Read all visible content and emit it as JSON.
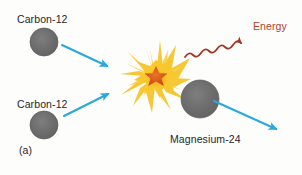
{
  "figure": {
    "caption_label": "(a)",
    "background_color": "#fdfdfc",
    "width": 302,
    "height": 175,
    "process": "nuclear fusion of two carbon-12 nuclei"
  },
  "labels": {
    "reactant_top": "Carbon-12",
    "reactant_bottom": "Carbon-12",
    "product_nucleus": "Magnesium-24",
    "product_energy": "Energy"
  },
  "colors": {
    "nucleus_fill": "#6e6e6e",
    "nucleus_stroke": "#585858",
    "arrow_blue": "#29a8dd",
    "energy_red": "#a33322",
    "burst_outer": "#f5c02a",
    "burst_mid": "#fbd34b",
    "burst_core": "#e0641b",
    "text": "#26262a"
  },
  "nuclei": [
    {
      "name": "carbon-12-top",
      "cx": 44,
      "cy": 42,
      "r": 14
    },
    {
      "name": "carbon-12-bottom",
      "cx": 44,
      "cy": 125,
      "r": 14
    },
    {
      "name": "magnesium-24",
      "cx": 200,
      "cy": 99,
      "r": 19
    }
  ],
  "burst": {
    "name": "fusion-burst",
    "cx": 156,
    "cy": 77,
    "outer_radius": 30,
    "core_radius": 9
  },
  "arrows": [
    {
      "name": "carbon-top-to-burst",
      "x1": 62,
      "y1": 45,
      "x2": 107,
      "y2": 66,
      "style": "straight",
      "color": "#29a8dd"
    },
    {
      "name": "carbon-bottom-to-burst",
      "x1": 64,
      "y1": 116,
      "x2": 108,
      "y2": 94,
      "style": "straight",
      "color": "#29a8dd"
    },
    {
      "name": "magnesium-outgoing",
      "x1": 214,
      "y1": 101,
      "x2": 276,
      "y2": 129,
      "style": "straight",
      "color": "#29a8dd"
    },
    {
      "name": "energy-emission",
      "x1": 185,
      "y1": 56,
      "x2": 250,
      "y2": 33,
      "style": "wavy",
      "color": "#a33322"
    }
  ]
}
